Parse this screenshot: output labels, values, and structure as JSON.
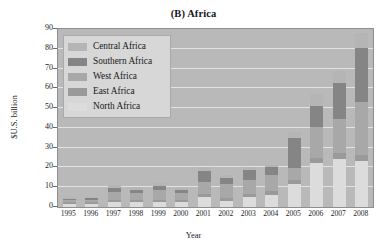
{
  "chart_data": {
    "type": "bar",
    "subtype": "stacked-bar",
    "title": "(B) Africa",
    "xlabel": "Year",
    "ylabel": "$U.S. billion",
    "ylim": [
      0,
      90
    ],
    "ytick_labels": [
      "0",
      "10",
      "20",
      "30",
      "40",
      "50",
      "60",
      "70",
      "80",
      "90"
    ],
    "ytick_values": [
      0,
      10,
      20,
      30,
      40,
      50,
      60,
      70,
      80,
      90
    ],
    "grid": true,
    "grid_axis": "y",
    "legend_position": "upper-left",
    "categories": [
      "1995",
      "1996",
      "1997",
      "1998",
      "1999",
      "2000",
      "2001",
      "2002",
      "2003",
      "2004",
      "2005",
      "2006",
      "2007",
      "2008"
    ],
    "series": [
      {
        "name": "North Africa",
        "color": "#dcdcdc",
        "values": [
          1.5,
          1.5,
          2.5,
          2.5,
          2.5,
          2.5,
          5.0,
          3.0,
          5.0,
          6.0,
          11.5,
          22.5,
          24.5,
          23.5
        ]
      },
      {
        "name": "East Africa",
        "color": "#9a9a9a",
        "values": [
          0.8,
          0.8,
          1.0,
          1.0,
          1.2,
          1.0,
          1.5,
          1.5,
          1.5,
          2.0,
          2.0,
          2.5,
          3.0,
          3.0
        ]
      },
      {
        "name": "West Africa",
        "color": "#a8a8a8",
        "values": [
          1.2,
          1.5,
          4.0,
          3.5,
          5.0,
          3.5,
          6.0,
          7.0,
          7.0,
          8.0,
          6.0,
          15.5,
          17.0,
          26.5
        ]
      },
      {
        "name": "Southern Africa",
        "color": "#858585",
        "values": [
          0.8,
          0.7,
          2.0,
          1.5,
          2.0,
          1.5,
          5.5,
          3.0,
          5.0,
          4.0,
          15.5,
          10.5,
          18.0,
          27.5
        ]
      },
      {
        "name": "Central Africa",
        "color": "#b5b5b5",
        "values": [
          0.7,
          0.5,
          1.5,
          1.5,
          1.3,
          1.0,
          2.0,
          1.5,
          1.5,
          1.0,
          3.0,
          6.0,
          6.5,
          7.5
        ]
      }
    ],
    "totals": [
      5.0,
      5.0,
      11.0,
      10.0,
      12.0,
      9.5,
      20.0,
      16.0,
      20.0,
      21.0,
      38.0,
      57.0,
      69.0,
      88.0
    ]
  },
  "legend": {
    "items": [
      {
        "label": "Central Africa",
        "color": "#b5b5b5"
      },
      {
        "label": "Southern Africa",
        "color": "#858585"
      },
      {
        "label": "West Africa",
        "color": "#a8a8a8"
      },
      {
        "label": "East Africa",
        "color": "#9a9a9a"
      },
      {
        "label": "North Africa",
        "color": "#dcdcdc"
      }
    ]
  },
  "colors": {
    "plot_background": "#b9b9b9",
    "gridline": "#e2e2e2",
    "axis": "#8e8e8e",
    "legend_background": "#d7d7d7",
    "text": "#17181b",
    "page_background": "#ffffff"
  }
}
